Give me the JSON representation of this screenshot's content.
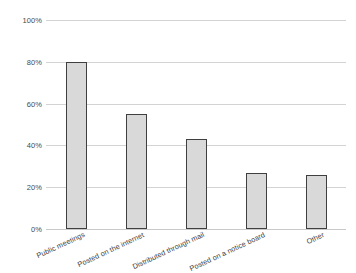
{
  "chart_data": {
    "type": "bar",
    "title": "",
    "subtitle": "",
    "xlabel": "",
    "ylabel": "",
    "categories": [
      "Public meetings",
      "Posted on the internet",
      "Distributed through mail",
      "Posted on a notice board",
      "Other"
    ],
    "values": [
      80,
      55,
      43,
      27,
      26
    ],
    "ylim": [
      0,
      100
    ],
    "ytick_labels": [
      "0%",
      "20%",
      "40%",
      "60%",
      "80%",
      "100%"
    ],
    "ytick_values": [
      0,
      20,
      40,
      60,
      80,
      100
    ],
    "grid": true,
    "legend": false,
    "legend_position": "none",
    "value_format": "percent",
    "colors": {
      "bar_fill": "#d9d9d9",
      "bar_border": "#3f3f3f",
      "gridline": "#d3d3d3",
      "tick_text": "#4a4a4a",
      "category_text": "#3d3d3d",
      "background": "#ffffff"
    },
    "label_rotation_degrees": -25
  }
}
